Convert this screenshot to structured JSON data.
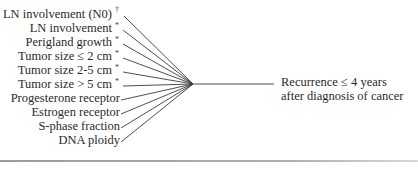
{
  "diagram": {
    "predictors": [
      {
        "label": "LN involvement (N0)",
        "mark": "†"
      },
      {
        "label": "LN involvement",
        "mark": "*"
      },
      {
        "label": "Perigland growth",
        "mark": "*"
      },
      {
        "label": "Tumor size ≤  2 cm",
        "mark": "*"
      },
      {
        "label": "Tumor size 2-5 cm",
        "mark": "*"
      },
      {
        "label": "Tumor size > 5 cm",
        "mark": "*"
      },
      {
        "label": "Progesterone receptor",
        "mark": ""
      },
      {
        "label": "Estrogen receptor",
        "mark": ""
      },
      {
        "label": "S-phase fraction",
        "mark": ""
      },
      {
        "label": "DNA ploidy",
        "mark": ""
      }
    ],
    "outcome": {
      "line1": "Recurrence ≤ 4 years",
      "line2": "after diagnosis of cancer"
    },
    "colors": {
      "text": "#2a2a2a",
      "line": "#3a3a3a"
    }
  }
}
